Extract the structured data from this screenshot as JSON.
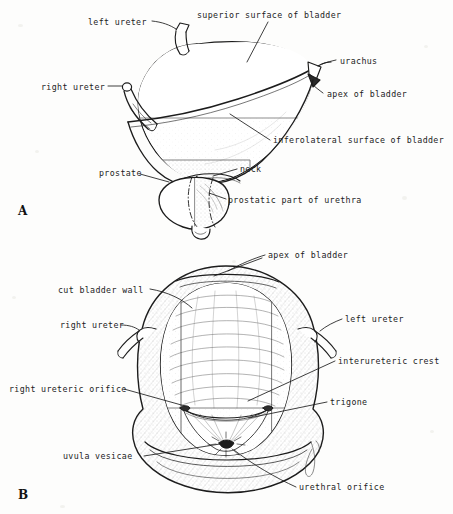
{
  "figure": {
    "background_color": "#fdfdfc",
    "ink_color": "#1c1c1c",
    "width": 453,
    "height": 514
  },
  "panels": [
    {
      "letter": "A",
      "caption": "external view of the male urinary bladder and prostate",
      "letter_x": 18,
      "letter_y": 205
    },
    {
      "letter": "B",
      "caption": "interior of the bladder seen from above, posterior wall opened",
      "letter_x": 18,
      "letter_y": 489
    }
  ],
  "labels_a": [
    {
      "text": "left ureter",
      "x": 88,
      "y": 23,
      "align": "left"
    },
    {
      "text": "superior surface of bladder",
      "x": 197,
      "y": 15,
      "align": "left"
    },
    {
      "text": "urachus",
      "x": 340,
      "y": 62,
      "align": "left"
    },
    {
      "text": "right ureter",
      "x": 41,
      "y": 88,
      "align": "left"
    },
    {
      "text": "apex of bladder",
      "x": 327,
      "y": 96,
      "align": "left"
    },
    {
      "text": "inferolateral surface of bladder",
      "x": 273,
      "y": 142,
      "align": "left"
    },
    {
      "text": "prostate",
      "x": 99,
      "y": 172,
      "align": "left"
    },
    {
      "text": "neck",
      "x": 240,
      "y": 169,
      "align": "left"
    },
    {
      "text": "prostatic part of urethra",
      "x": 228,
      "y": 201,
      "align": "left"
    }
  ],
  "labels_b": [
    {
      "text": "apex of bladder",
      "x": 268,
      "y": 256,
      "align": "left"
    },
    {
      "text": "cut bladder wall",
      "x": 58,
      "y": 291,
      "align": "left"
    },
    {
      "text": "right ureter",
      "x": 60,
      "y": 327,
      "align": "left"
    },
    {
      "text": "left ureter",
      "x": 345,
      "y": 321,
      "align": "left"
    },
    {
      "text": "interureteric crest",
      "x": 338,
      "y": 363,
      "align": "left"
    },
    {
      "text": "right ureteric orifice",
      "x": 9,
      "y": 391,
      "align": "left"
    },
    {
      "text": "trigone",
      "x": 330,
      "y": 404,
      "align": "left"
    },
    {
      "text": "uvula vesicae",
      "x": 63,
      "y": 458,
      "align": "left"
    },
    {
      "text": "urethral orifice",
      "x": 299,
      "y": 489,
      "align": "left"
    }
  ],
  "artwork": {
    "style": "pen-and-ink line drawing with stipple and hatch shading",
    "panel_a_subject": "bladder viewed from the left front with both ureters, urachus, apex, neck and prostate",
    "panel_b_subject": "opened bladder showing rugose mucosa, trigone, ureteric orifices and urethral orifice"
  }
}
